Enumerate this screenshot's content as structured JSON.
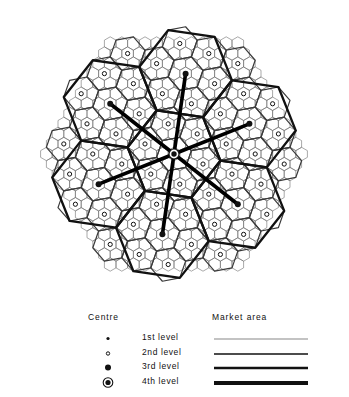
{
  "figure": {
    "kind": "central-place-hierarchy-diagram"
  },
  "legend": {
    "centre_header": "Centre",
    "market_header": "Market area",
    "rows": [
      {
        "label": "1st  level",
        "symbol": "small-filled-dot",
        "symbol_radius": 1.6,
        "line_width": 0.7
      },
      {
        "label": "2nd level",
        "symbol": "open-circle",
        "symbol_radius": 2.2,
        "line_width": 1.4
      },
      {
        "label": "3rd  level",
        "symbol": "filled-dot",
        "symbol_radius": 3.0,
        "line_width": 2.6
      },
      {
        "label": "4th  level",
        "symbol": "dot-in-ring",
        "symbol_radius": 3.2,
        "line_width": 4.2
      }
    ]
  },
  "lattice": {
    "centre_x": 174,
    "centre_y": 152,
    "unit": 11.6,
    "levels": 4,
    "k_value": 7,
    "level_line_widths": [
      0.6,
      1.2,
      2.3,
      3.6
    ],
    "level_colors": [
      "#6f6f6f",
      "#3a3a3a",
      "#111111",
      "#000000"
    ],
    "outline_radius_units": 11,
    "marker_levels": {
      "l1": "small-filled-dot",
      "l2": "open-circle",
      "l3": "filled-dot",
      "l4": "dot-in-ring"
    }
  }
}
